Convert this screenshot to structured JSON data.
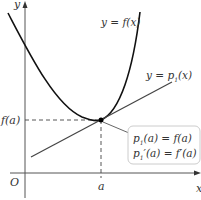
{
  "diagram": {
    "axes": {
      "x_label": "x",
      "y_label": "y",
      "origin_label": "O"
    },
    "curve_label": "y = f(x)",
    "tangent_label": {
      "prefix": "y = p",
      "sub": "1",
      "suffix": "(x)"
    },
    "point_labels": {
      "x_tick": "a",
      "y_tick": "f(a)"
    },
    "callout": {
      "line1": {
        "prefix": "p",
        "sub": "1",
        "suffix": "(a) = f(a)"
      },
      "line2": {
        "prefix": "p",
        "sub": "1",
        "suffix": "′(a) = f′(a)"
      }
    },
    "colors": {
      "axis": "#555555",
      "curve": "#111111",
      "tangent": "#444444",
      "callout_border": "#cccccc"
    }
  }
}
